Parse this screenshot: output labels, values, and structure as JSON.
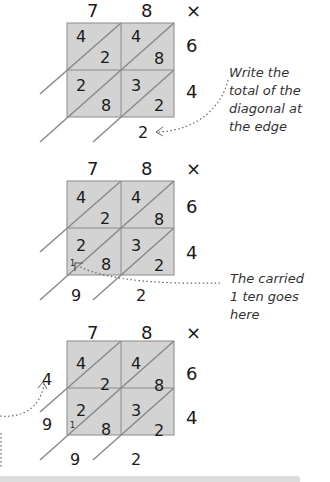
{
  "colors": {
    "grid_fill": "#d3d3d3",
    "grid_line": "#8a8a8a",
    "text": "#1a1a1a",
    "note_text": "#333333",
    "dotted_arrow": "#666666"
  },
  "multiplication": {
    "top_digits": [
      "7",
      "8"
    ],
    "operator": "×",
    "side_digits": [
      "6",
      "4"
    ],
    "cells": [
      {
        "row": 0,
        "col": 0,
        "tens": "4",
        "ones": "2"
      },
      {
        "row": 0,
        "col": 1,
        "tens": "4",
        "ones": "8"
      },
      {
        "row": 1,
        "col": 0,
        "tens": "2",
        "ones": "8"
      },
      {
        "row": 1,
        "col": 1,
        "tens": "3",
        "ones": "2"
      }
    ]
  },
  "steps": [
    {
      "results": {
        "bottom_right": "2"
      },
      "note": "Write the\ntotal of the\ndiagonal at\nthe edge"
    },
    {
      "results": {
        "bottom_right": "2",
        "bottom_left": "9",
        "carry": "1"
      },
      "note": "The carried\n1 ten goes here"
    },
    {
      "results": {
        "bottom_right": "2",
        "bottom_left": "9",
        "left_lower": "9",
        "left_upper": "4",
        "carry": "1"
      }
    }
  ]
}
